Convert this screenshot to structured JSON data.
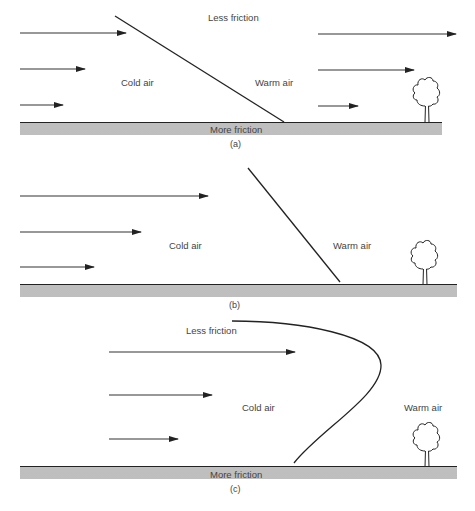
{
  "figure": {
    "panels": [
      {
        "id": "a",
        "caption": "(a)",
        "labels": {
          "top": "Less friction",
          "bottom": "More friction",
          "cold": "Cold air",
          "warm": "Warm air"
        },
        "front_shape": "straight line sloping down toward warm air (shallow)",
        "cold_side_arrows": [
          "long",
          "medium",
          "short"
        ],
        "warm_side_arrows": [
          "long",
          "medium",
          "short"
        ]
      },
      {
        "id": "b",
        "caption": "(b)",
        "labels": {
          "cold": "Cold air",
          "warm": "Warm air"
        },
        "front_shape": "steepened straight line",
        "cold_side_arrows": [
          "long",
          "medium",
          "short"
        ]
      },
      {
        "id": "c",
        "caption": "(c)",
        "labels": {
          "top": "Less friction",
          "bottom": "More friction",
          "cold": "Cold air",
          "warm": "Warm air"
        },
        "front_shape": "bulging nose (curved front)",
        "cold_side_arrows": [
          "long",
          "medium",
          "short"
        ]
      }
    ],
    "icons": [
      "arrow-icon",
      "tree-icon",
      "ground-hatch"
    ]
  }
}
